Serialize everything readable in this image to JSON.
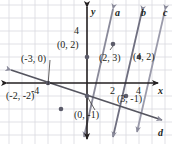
{
  "figure": {
    "kind": "coordinate-plane-graph",
    "width": 172,
    "height": 144,
    "background": "#ffffff",
    "grid_color": "#d9d9e0",
    "axis_color": "#231f20",
    "line_color": "#8a8a9a",
    "point_color": "#6f6f80",
    "label_color": "#231f20"
  },
  "axes": {
    "x_label": "x",
    "y_label": "y",
    "x_ticks": [
      {
        "label": "-4",
        "value": -4
      },
      {
        "label": "2",
        "value": 2
      },
      {
        "label": "4",
        "value": 4
      }
    ],
    "y_ticks": [
      {
        "label": "4",
        "value": 4
      }
    ],
    "xlim": [
      -6.7,
      6.5
    ],
    "ylim": [
      -4.7,
      4.7
    ],
    "origin_px": [
      87,
      83
    ],
    "unit_px": 13
  },
  "lines": [
    {
      "name": "a",
      "label": "a",
      "slope": 1.5,
      "intercept": 2,
      "label_pos": [
        115,
        10
      ]
    },
    {
      "name": "b",
      "label": "b",
      "slope": 1.5,
      "intercept": -1,
      "label_pos": [
        140,
        10
      ]
    },
    {
      "name": "c",
      "label": "c",
      "slope": 1.5,
      "intercept": -4,
      "label_pos": [
        163,
        10
      ]
    },
    {
      "name": "d",
      "label": "d",
      "slope": -0.3333,
      "intercept": -1,
      "label_pos": [
        160,
        131
      ]
    }
  ],
  "points": [
    {
      "label": "(0, 2)",
      "x": 0,
      "y": 2,
      "label_pos": [
        57,
        40
      ]
    },
    {
      "label": "(-3, 0)",
      "x": -3,
      "y": 0,
      "label_pos": [
        21,
        54
      ]
    },
    {
      "label": "(2, 3)",
      "x": 2,
      "y": 3,
      "label_pos": [
        99,
        53
      ]
    },
    {
      "label": "(4, 2)",
      "x": 4,
      "y": 2,
      "label_pos": [
        133,
        52
      ]
    },
    {
      "label": "(-2, -2)",
      "x": -2,
      "y": -2,
      "label_pos": [
        6,
        91
      ]
    },
    {
      "label": "(3, -1)",
      "x": 3,
      "y": -1,
      "label_pos": [
        117,
        94
      ]
    },
    {
      "label": "(0, -1)",
      "x": 0,
      "y": -1,
      "label_pos": [
        74,
        110
      ]
    }
  ]
}
